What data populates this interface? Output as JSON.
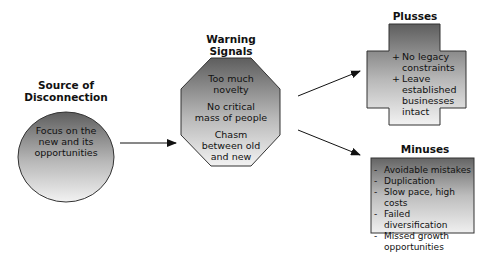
{
  "diagram": {
    "source": {
      "title_lines": [
        "Source of",
        "Disconnection"
      ],
      "body_lines": [
        "Focus on the",
        "new and its",
        "opportunities"
      ]
    },
    "warning": {
      "title_lines": [
        "Warning",
        "Signals"
      ],
      "items": [
        {
          "lines": [
            "Too much",
            "novelty"
          ]
        },
        {
          "lines": [
            "No critical",
            "mass of people"
          ]
        },
        {
          "lines": [
            "Chasm",
            "between old",
            "and new"
          ]
        }
      ]
    },
    "plusses": {
      "title": "Plusses",
      "marker": "+",
      "items": [
        {
          "text": "No legacy constraints"
        },
        {
          "text": "Leave established businesses intact"
        }
      ]
    },
    "minuses": {
      "title": "Minuses",
      "marker": "-",
      "items": [
        {
          "text": "Avoidable mistakes"
        },
        {
          "text": "Duplication"
        },
        {
          "text": "Slow pace, high costs"
        },
        {
          "text": "Failed diversification"
        },
        {
          "text": "Missed growth opportunities"
        }
      ]
    },
    "arrows": [
      {
        "from": "source",
        "to": "warning"
      },
      {
        "from": "warning",
        "to": "plusses"
      },
      {
        "from": "warning",
        "to": "minuses"
      }
    ],
    "colors": {
      "shape_dark": "#5e5e5e",
      "shape_light": "#f2f2f2",
      "stroke": "#333333",
      "text": "#111111"
    }
  }
}
